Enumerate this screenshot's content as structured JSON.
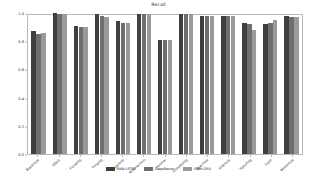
{
  "chart_data": {
    "type": "bar",
    "title": "Recall",
    "xlabel": "",
    "ylabel": "",
    "ylim": [
      0.0,
      1.0
    ],
    "yticks": [
      "0.0",
      "0.2",
      "0.4",
      "0.6",
      "0.8",
      "1.0"
    ],
    "ytick_values": [
      0.0,
      0.2,
      0.4,
      0.6,
      0.8,
      1.0
    ],
    "grid": false,
    "legend_position": "bottom-center",
    "orientation": "vertical",
    "categories": [
      "Blackhole",
      "DDoS",
      "Flooding",
      "Forging",
      "Grayhole",
      "Misdirection",
      "Normal",
      "Scheduling",
      "Selective",
      "Sinkhole",
      "Spoofing",
      "Sybil",
      "Wormhole"
    ],
    "series": [
      {
        "name": "RNN-LSTM",
        "color": "#3f3f3f",
        "values": [
          0.87,
          1.0,
          0.91,
          0.99,
          0.94,
          0.99,
          0.81,
          0.99,
          0.98,
          0.98,
          0.93,
          0.92,
          0.98
        ]
      },
      {
        "name": "DeepRecon",
        "color": "#6e6e6e",
        "values": [
          0.85,
          0.99,
          0.9,
          0.98,
          0.93,
          0.99,
          0.81,
          0.99,
          0.98,
          0.98,
          0.92,
          0.93,
          0.97
        ]
      },
      {
        "name": "GNN-GRU",
        "color": "#9a9a9a",
        "values": [
          0.86,
          0.99,
          0.9,
          0.97,
          0.93,
          0.99,
          0.81,
          0.99,
          0.98,
          0.98,
          0.88,
          0.95,
          0.97
        ]
      }
    ]
  },
  "figure": {
    "background": "#ffffff",
    "frame_color": "#b9b9b9"
  }
}
